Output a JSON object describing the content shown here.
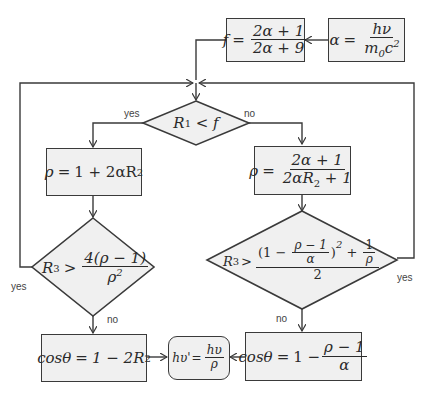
{
  "diagram": {
    "type": "flowchart",
    "colors": {
      "box_fill": "#f0f0f0",
      "stroke": "#3a3a3a",
      "background": "#ffffff"
    },
    "nodes": {
      "alpha_def": {
        "lhs": "α",
        "eq": "=",
        "num": "hν",
        "den_m": "m",
        "den_sub": "0",
        "den_c": "c",
        "den_sup": "2"
      },
      "f_def": {
        "lhs": "f",
        "eq": "=",
        "num": "2α + 1",
        "den": "2α + 9"
      },
      "decision_main": {
        "text": "R",
        "sub": "1",
        "rest": " < f"
      },
      "rho_left": {
        "lhs": "ρ",
        "eq": "=",
        "rhs1": "1 + 2αR",
        "rhs_sub": "2"
      },
      "rho_right": {
        "lhs": "ρ",
        "eq": "=",
        "num": "2α + 1",
        "den1": "2αR",
        "den_sub": "2",
        "den2": " + 1"
      },
      "decision_left": {
        "lhs": "R",
        "lhs_sub": "3",
        "op": ">",
        "num": "4(ρ − 1)",
        "den": "ρ",
        "den_sup": "2"
      },
      "decision_right": {
        "lhs": "R",
        "lhs_sub": "3",
        "op": ">",
        "num_part1": "(1 − ",
        "inner_num": "ρ − 1",
        "inner_den": "α",
        "num_part2": ")",
        "num_sup": "2",
        "num_plus": " + ",
        "recip_num": "1",
        "recip_den": "ρ",
        "den": "2"
      },
      "cos_left": {
        "lhs": "cosθ",
        "eq": "=",
        "rhs1": "1 − 2R",
        "rhs_sub": "2"
      },
      "cos_right": {
        "lhs": "cosθ",
        "eq": "=",
        "rhs1": "1 −",
        "num": "ρ − 1",
        "den": "α"
      },
      "result": {
        "lhs": "hυ'",
        "eq": "=",
        "num": "hυ",
        "den": "ρ"
      }
    },
    "labels": {
      "main_yes": "yes",
      "main_no": "no",
      "left_yes": "yes",
      "left_no": "no",
      "right_yes": "yes",
      "right_no": "no"
    }
  }
}
